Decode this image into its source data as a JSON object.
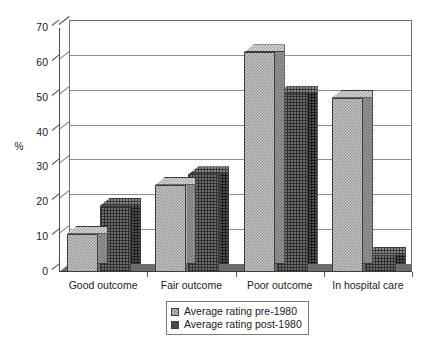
{
  "chart_data": {
    "type": "bar",
    "title": "",
    "xlabel": "",
    "ylabel": "%",
    "ylim": [
      0,
      70
    ],
    "yticks": [
      0,
      10,
      20,
      30,
      40,
      50,
      60,
      70
    ],
    "grid": true,
    "legend_position": "bottom-center",
    "style": "3d-grouped-bar",
    "categories": [
      "Good outcome",
      "Fair outcome",
      "Poor outcome",
      "In hospital care"
    ],
    "series": [
      {
        "name": "Average rating pre-1980",
        "swatch": "light-checker",
        "color": "#c6c6c6",
        "values": [
          11,
          25,
          63,
          50
        ]
      },
      {
        "name": "Average rating post-1980",
        "swatch": "dark-solid",
        "color": "#4a4a4a",
        "values": [
          19,
          28,
          51,
          5
        ]
      }
    ]
  },
  "axis": {
    "y_label": "%",
    "y_ticks": [
      "0",
      "10",
      "20",
      "30",
      "40",
      "50",
      "60",
      "70"
    ]
  },
  "categories": [
    {
      "label": "Good outcome"
    },
    {
      "label": "Fair outcome"
    },
    {
      "label": "Poor outcome"
    },
    {
      "label": "In hospital care"
    }
  ],
  "legend": {
    "entries": [
      {
        "label": "Average rating pre-1980"
      },
      {
        "label": "Average rating post-1980"
      }
    ]
  }
}
